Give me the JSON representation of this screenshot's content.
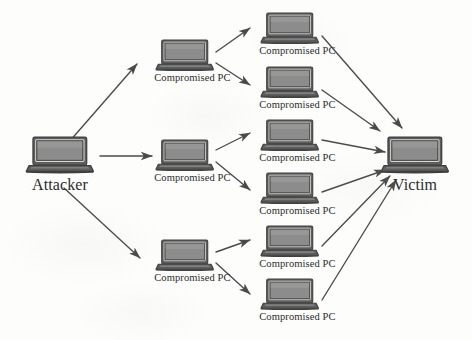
{
  "figure": {
    "background_color": "#fdfdfc",
    "line_color": "#4a4a4a",
    "text_color": "#2b2b2b",
    "laptop_screen_color": "#8c8c8c",
    "laptop_body_color": "#5e5e5e",
    "laptop_bezel_color": "#3f3f3f"
  },
  "labels": {
    "attacker": "Attacker",
    "victim": "Victim",
    "compromised_pc": "Compromised PC"
  },
  "icons": {
    "laptop": "laptop-icon",
    "arrow": "arrow-icon"
  },
  "nodes": [
    {
      "id": "attacker",
      "role": "attacker",
      "label": "Attacker",
      "x": 60,
      "y": 155,
      "size": "large",
      "label_size": "big"
    },
    {
      "id": "tier1-1",
      "role": "compromised-pc",
      "label": "Compromised PC",
      "x": 185,
      "y": 55,
      "size": "small",
      "label_size": "small"
    },
    {
      "id": "tier1-2",
      "role": "compromised-pc",
      "label": "Compromised PC",
      "x": 185,
      "y": 155,
      "size": "small",
      "label_size": "small"
    },
    {
      "id": "tier1-3",
      "role": "compromised-pc",
      "label": "Compromised PC",
      "x": 185,
      "y": 255,
      "size": "small",
      "label_size": "small"
    },
    {
      "id": "tier2-1",
      "role": "compromised-pc",
      "label": "Compromised PC",
      "x": 290,
      "y": 28,
      "size": "small",
      "label_size": "small"
    },
    {
      "id": "tier2-2",
      "role": "compromised-pc",
      "label": "Compromised PC",
      "x": 290,
      "y": 82,
      "size": "small",
      "label_size": "small"
    },
    {
      "id": "tier2-3",
      "role": "compromised-pc",
      "label": "Compromised PC",
      "x": 290,
      "y": 135,
      "size": "small",
      "label_size": "small"
    },
    {
      "id": "tier2-4",
      "role": "compromised-pc",
      "label": "Compromised PC",
      "x": 290,
      "y": 188,
      "size": "small",
      "label_size": "small"
    },
    {
      "id": "tier2-5",
      "role": "compromised-pc",
      "label": "Compromised PC",
      "x": 290,
      "y": 241,
      "size": "small",
      "label_size": "small"
    },
    {
      "id": "tier2-6",
      "role": "compromised-pc",
      "label": "Compromised PC",
      "x": 290,
      "y": 294,
      "size": "small",
      "label_size": "small"
    },
    {
      "id": "victim",
      "role": "victim",
      "label": "Victim",
      "x": 415,
      "y": 155,
      "size": "large",
      "label_size": "big"
    }
  ],
  "edges": [
    {
      "from": "attacker",
      "to": "tier1-1",
      "x1": 62,
      "y1": 150,
      "x2": 137,
      "y2": 64
    },
    {
      "from": "attacker",
      "to": "tier1-2",
      "x1": 100,
      "y1": 156,
      "x2": 152,
      "y2": 156
    },
    {
      "from": "attacker",
      "to": "tier1-3",
      "x1": 64,
      "y1": 188,
      "x2": 140,
      "y2": 258
    },
    {
      "from": "tier1-1",
      "to": "tier2-1",
      "x1": 216,
      "y1": 52,
      "x2": 250,
      "y2": 28
    },
    {
      "from": "tier1-1",
      "to": "tier2-2",
      "x1": 216,
      "y1": 63,
      "x2": 250,
      "y2": 85
    },
    {
      "from": "tier1-2",
      "to": "tier2-3",
      "x1": 216,
      "y1": 150,
      "x2": 250,
      "y2": 133
    },
    {
      "from": "tier1-2",
      "to": "tier2-4",
      "x1": 216,
      "y1": 162,
      "x2": 250,
      "y2": 190
    },
    {
      "from": "tier1-3",
      "to": "tier2-5",
      "x1": 216,
      "y1": 252,
      "x2": 250,
      "y2": 240
    },
    {
      "from": "tier1-3",
      "to": "tier2-6",
      "x1": 216,
      "y1": 263,
      "x2": 250,
      "y2": 294
    },
    {
      "from": "tier2-1",
      "to": "victim",
      "x1": 322,
      "y1": 36,
      "x2": 402,
      "y2": 128
    },
    {
      "from": "tier2-2",
      "to": "victim",
      "x1": 322,
      "y1": 90,
      "x2": 380,
      "y2": 131
    },
    {
      "from": "tier2-3",
      "to": "victim",
      "x1": 322,
      "y1": 140,
      "x2": 385,
      "y2": 152
    },
    {
      "from": "tier2-4",
      "to": "victim",
      "x1": 322,
      "y1": 192,
      "x2": 385,
      "y2": 170
    },
    {
      "from": "tier2-5",
      "to": "victim",
      "x1": 322,
      "y1": 246,
      "x2": 390,
      "y2": 176
    },
    {
      "from": "tier2-6",
      "to": "victim",
      "x1": 322,
      "y1": 300,
      "x2": 396,
      "y2": 180
    }
  ]
}
